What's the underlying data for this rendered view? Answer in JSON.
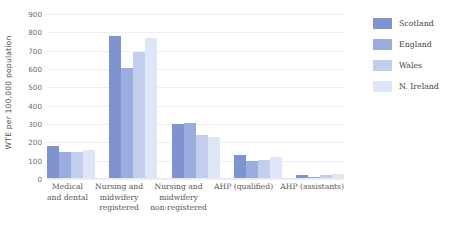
{
  "chart_data": {
    "type": "bar",
    "title": "",
    "xlabel": "",
    "ylabel": "WTE per 100,000 population",
    "ylim": [
      0,
      900
    ],
    "yticks": [
      0,
      100,
      200,
      300,
      400,
      500,
      600,
      700,
      800,
      900
    ],
    "grid": true,
    "legend_position": "right",
    "categories": [
      "Medical\nand dental",
      "Nursing and\nmidwifery\nregistered",
      "Nursing and\nmidwifery\nnon-registered",
      "AHP (qualified)",
      "AHP (assistants)"
    ],
    "category_lines": [
      [
        "Medical",
        "and dental"
      ],
      [
        "Nursing and",
        "midwifery",
        "registered"
      ],
      [
        "Nursing and",
        "midwifery",
        "non-registered"
      ],
      [
        "AHP (qualified)"
      ],
      [
        "AHP (assistants)"
      ]
    ],
    "series": [
      {
        "name": "Scotland",
        "color": "#7f93d1",
        "values": [
          180,
          780,
          300,
          130,
          22
        ]
      },
      {
        "name": "England",
        "color": "#9badde",
        "values": [
          150,
          605,
          305,
          100,
          12
        ]
      },
      {
        "name": "Wales",
        "color": "#c3cdee",
        "values": [
          150,
          695,
          240,
          105,
          20
        ]
      },
      {
        "name": "N. Ireland",
        "color": "#dfe6f7",
        "values": [
          160,
          770,
          230,
          120,
          25
        ]
      }
    ]
  },
  "legend": {
    "items": [
      {
        "label": "Scotland",
        "color": "#7f93d1"
      },
      {
        "label": "England",
        "color": "#9badde"
      },
      {
        "label": "Wales",
        "color": "#c3cdee"
      },
      {
        "label": "N. Ireland",
        "color": "#dfe6f7"
      }
    ]
  },
  "axis": {
    "y_title": "WTE per 100,000 population",
    "y_tick_labels": [
      "900",
      "800",
      "700",
      "600",
      "500",
      "400",
      "300",
      "200",
      "100",
      "0"
    ]
  }
}
